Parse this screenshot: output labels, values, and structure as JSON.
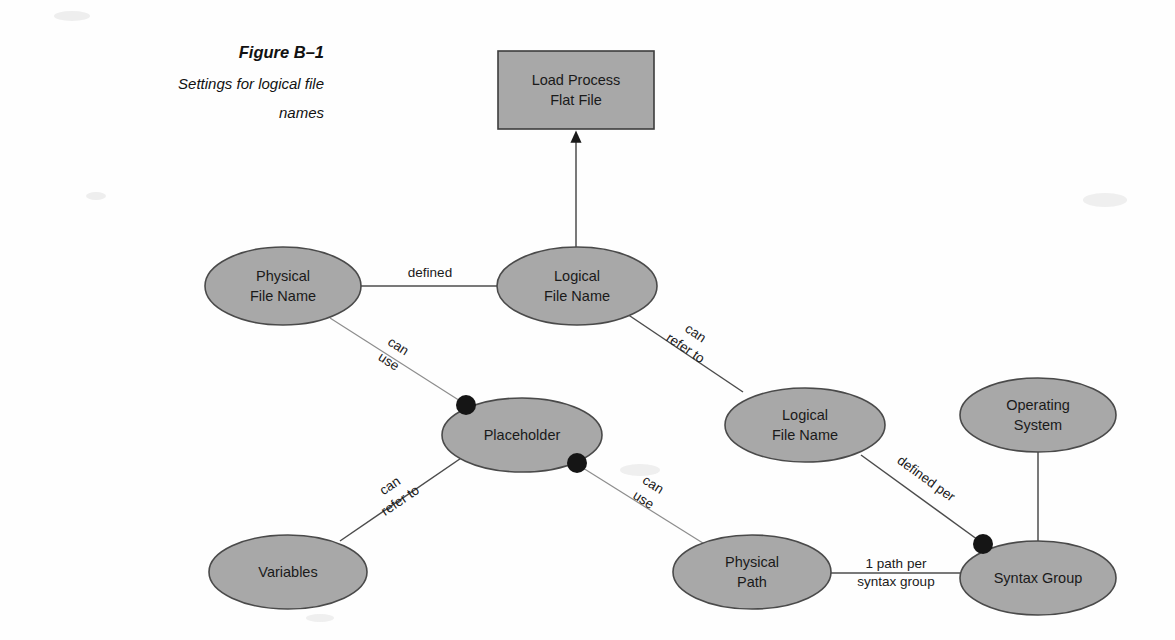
{
  "figure": {
    "caption_title": "Figure B–1",
    "caption_subtitle_line1": "Settings for logical file",
    "caption_subtitle_line2": "names"
  },
  "colors": {
    "node_fill": "#a8a8a8",
    "node_stroke": "#4a4a4a",
    "edge": "#4c4c4c",
    "edge_light": "#8d8d8d",
    "dot": "#151515",
    "background": "#fefefe",
    "text": "#1a1a1a"
  },
  "nodes": {
    "load_process": {
      "line1": "Load Process",
      "line2": "Flat File",
      "shape": "rectangle"
    },
    "physical_file_name": {
      "line1": "Physical",
      "line2": "File Name",
      "shape": "ellipse"
    },
    "logical_file_name_top": {
      "line1": "Logical",
      "line2": "File Name",
      "shape": "ellipse"
    },
    "placeholder": {
      "line1": "Placeholder",
      "line2": "",
      "shape": "ellipse"
    },
    "logical_file_name_mid": {
      "line1": "Logical",
      "line2": "File Name",
      "shape": "ellipse"
    },
    "operating_system": {
      "line1": "Operating",
      "line2": "System",
      "shape": "ellipse"
    },
    "variables": {
      "line1": "Variables",
      "line2": "",
      "shape": "ellipse"
    },
    "physical_path": {
      "line1": "Physical",
      "line2": "Path",
      "shape": "ellipse"
    },
    "syntax_group": {
      "line1": "Syntax Group",
      "line2": "",
      "shape": "ellipse"
    }
  },
  "edges": {
    "defined": {
      "line1": "defined",
      "line2": ""
    },
    "pfn_to_placeholder": {
      "line1": "can",
      "line2": "use"
    },
    "lfn_to_lfn": {
      "line1": "can",
      "line2": "refer to"
    },
    "variables_to_placeholder": {
      "line1": "can",
      "line2": "refer to"
    },
    "placeholder_to_path": {
      "line1": "can",
      "line2": "use"
    },
    "lfn_to_syntax": {
      "line1": "defined per",
      "line2": ""
    },
    "path_to_syntax": {
      "line1": "1 path per",
      "line2": "syntax group"
    }
  }
}
